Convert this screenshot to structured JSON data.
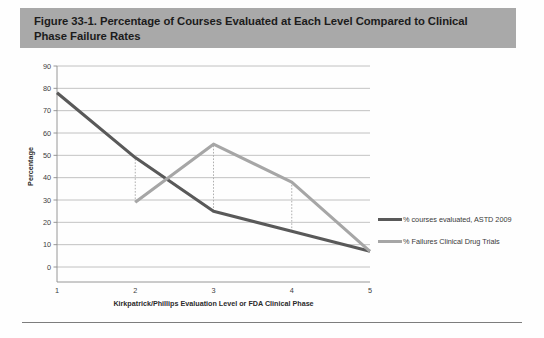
{
  "figure": {
    "title": "Figure 33-1. Percentage of Courses Evaluated at Each Level Compared to Clinical Phase Failure Rates"
  },
  "colors": {
    "banner": "#a9a9a9",
    "series_dark": "#595959",
    "series_light": "#a6a6a6",
    "gridline": "#b3b3b3",
    "axis": "#8c8c8c",
    "dropline": "#a6a6a6"
  },
  "chart_data": {
    "type": "line",
    "title": "",
    "xlabel": "Kirkpatrick/Phillips Evaluation Level or FDA Clinical Phase",
    "ylabel": "Percentage",
    "categories": [
      "1",
      "2",
      "3",
      "4",
      "5"
    ],
    "x": [
      1,
      2,
      3,
      4,
      5
    ],
    "xlim": [
      1,
      5
    ],
    "ylim": [
      0,
      90
    ],
    "ytick_labels": [
      "0",
      "10",
      "20",
      "30",
      "40",
      "50",
      "60",
      "70",
      "80",
      "90"
    ],
    "yticks": [
      0,
      10,
      20,
      30,
      40,
      50,
      60,
      70,
      80,
      90
    ],
    "xtick_labels": [
      "1",
      "2",
      "3",
      "4",
      "5"
    ],
    "grid": true,
    "grid_axis": "y",
    "legend_position": "right",
    "series": [
      {
        "name": "% courses evaluated, ASTD 2009",
        "color": "#595959",
        "values": [
          78,
          49,
          25,
          16,
          7
        ]
      },
      {
        "name": "% Failures Clinical Drug Trials",
        "color": "#a6a6a6",
        "values": [
          null,
          29,
          55,
          38,
          7
        ]
      }
    ],
    "droplines": [
      {
        "x": 2,
        "from": 29,
        "to": 49
      },
      {
        "x": 3,
        "from": 25,
        "to": 55
      },
      {
        "x": 4,
        "from": 16,
        "to": 38
      }
    ]
  },
  "legend": {
    "items": [
      {
        "label": "% courses evaluated, ASTD 2009",
        "color": "#595959"
      },
      {
        "label": "% Failures Clinical Drug Trials",
        "color": "#a6a6a6"
      }
    ]
  }
}
